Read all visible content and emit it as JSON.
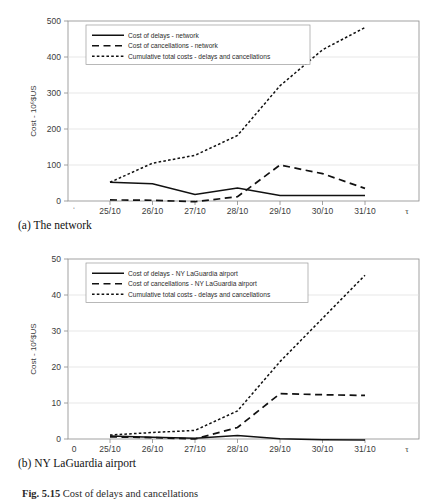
{
  "figure": {
    "caption_label": "Fig. 5.15",
    "caption_text": "Cost of delays and cancellations"
  },
  "panels": [
    {
      "id": "a",
      "subcaption": "(a) The network",
      "xlabel": "Duration of disruptive event - d/m",
      "ylabel": "Cost - 10⁶$US",
      "origin_label": "",
      "tau_symbol": "τ",
      "legend": [
        "Cost of delays - network",
        "Cost of cancellations - network",
        "Cumulative total costs - delays and cancellations"
      ],
      "chart_data": {
        "type": "line",
        "title": "",
        "xlabel": "Duration of disruptive event - d/m",
        "ylabel": "Cost - 10^6 $US",
        "categories": [
          "25/10",
          "26/10",
          "27/10",
          "28/10",
          "29/10",
          "30/10",
          "31/10"
        ],
        "ylim": [
          0,
          500
        ],
        "yticks": [
          0,
          100,
          200,
          300,
          400,
          500
        ],
        "grid": true,
        "legend_position": "top-left",
        "series": [
          {
            "name": "Cost of delays - network",
            "style": "solid",
            "values": [
              52,
              48,
              18,
              36,
              15,
              15,
              15
            ]
          },
          {
            "name": "Cost of cancellations - network",
            "style": "dashed",
            "values": [
              3,
              2,
              -2,
              12,
              100,
              76,
              35
            ]
          },
          {
            "name": "Cumulative total costs - delays and cancellations",
            "style": "dotted",
            "values": [
              52,
              105,
              127,
              182,
              320,
              420,
              482
            ]
          }
        ]
      }
    },
    {
      "id": "b",
      "subcaption": "(b) NY LaGuardia airport",
      "xlabel": "Duration of disruptive event - d/m",
      "ylabel": "Cost - 10⁶$US",
      "origin_label": "0",
      "tau_symbol": "τ",
      "legend": [
        "Cost of delays - NY LaGuardia airport",
        "Cost of cancellations - NY LaGuardia airport",
        "Cumulative total costs  - delays and cancellations"
      ],
      "chart_data": {
        "type": "line",
        "title": "",
        "xlabel": "Duration of disruptive event - d/m",
        "ylabel": "Cost - 10^6 $US",
        "categories": [
          "25/10",
          "26/10",
          "27/10",
          "28/10",
          "29/10",
          "30/10",
          "31/10"
        ],
        "ylim": [
          0,
          50
        ],
        "yticks": [
          0,
          10,
          20,
          30,
          40,
          50
        ],
        "grid": true,
        "legend_position": "top-left",
        "series": [
          {
            "name": "Cost of delays - NY LaGuardia airport",
            "style": "solid",
            "values": [
              0.8,
              0.5,
              0.2,
              1.0,
              0.1,
              -0.2,
              -0.3
            ]
          },
          {
            "name": "Cost of cancellations - NY LaGuardia airport",
            "style": "dashed",
            "values": [
              0.6,
              0.4,
              0.0,
              3.2,
              12.6,
              12.3,
              12.1
            ]
          },
          {
            "name": "Cumulative total costs  - delays and cancellations",
            "style": "dotted",
            "values": [
              1.1,
              1.8,
              2.4,
              7.8,
              21.5,
              33.5,
              45.5
            ]
          }
        ]
      }
    }
  ]
}
